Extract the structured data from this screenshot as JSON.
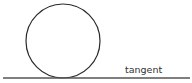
{
  "diagram": {
    "labels": {
      "tangent": "tangent"
    },
    "circle": {
      "cx": 63,
      "cy": 41,
      "r": 37,
      "stroke": "#2a2a2a"
    },
    "tangent_line": {
      "x1": 3,
      "x2": 190,
      "y": 78,
      "stroke": "#555555"
    }
  }
}
